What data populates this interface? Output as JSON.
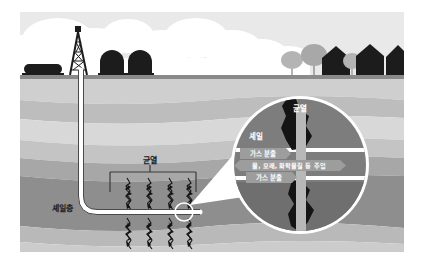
{
  "figure": {
    "language": "ko"
  },
  "colors": {
    "page_background": "#ffffff",
    "sky": "#e9e9e9",
    "cloud": "#ffffff",
    "ground_line": "#8a8a8a",
    "silhouette_dark": "#1c1c1c",
    "tree_gray": "#b4b4b4",
    "tree_gray_dark": "#9a9a9a",
    "layer_1": "#cfcfcf",
    "layer_2": "#bdbdbd",
    "layer_3": "#d8d8d8",
    "layer_4": "#c4c4c4",
    "layer_5": "#a7a7a7",
    "layer_6": "#8e8e8e",
    "layer_7": "#b9b9b9",
    "layer_8": "#cccccc",
    "shale_layer": "#8e8e8e",
    "well_casing": "#ffffff",
    "well_outline": "#4a4a4a",
    "fracture_black": "#141414",
    "callout_ring": "#ffffff",
    "callout_rock_upper": "#7d7d7d",
    "callout_rock_lower": "#6f6f6f",
    "callout_band": "#ffffff",
    "callout_pipe": "#b0b0b0",
    "label_chip": "#9d9d9d",
    "label_text": "#ffffff",
    "label_text_dark": "#1a1a1a"
  },
  "labels": {
    "fracture_main": "균열",
    "shale_layer": "셰일층",
    "callout_fracture": "균열",
    "callout_shale": "셰일",
    "gas_out_upper": "가스 분출",
    "injection": "물, 모래, 화학물질 등 주입",
    "gas_out_lower": "가스 분출"
  },
  "surface_features": [
    {
      "name": "horizontal-storage-tank",
      "x": 26,
      "y": 66
    },
    {
      "name": "drilling-derrick",
      "x": 72,
      "y": 30
    },
    {
      "name": "storage-tank-left",
      "x": 112,
      "y": 57
    },
    {
      "name": "storage-tank-right",
      "x": 140,
      "y": 57
    },
    {
      "name": "tree-gray-1",
      "x": 292,
      "y": 54
    },
    {
      "name": "tree-gray-2",
      "x": 312,
      "y": 48
    },
    {
      "name": "house-dark-1",
      "x": 326,
      "y": 48
    },
    {
      "name": "tree-gray-3",
      "x": 350,
      "y": 55
    },
    {
      "name": "house-dark-2",
      "x": 358,
      "y": 47
    },
    {
      "name": "house-dark-3",
      "x": 390,
      "y": 45
    }
  ],
  "fractures_upper": [
    {
      "x": 127
    },
    {
      "x": 148
    },
    {
      "x": 169
    },
    {
      "x": 188
    }
  ],
  "fractures_lower": [
    {
      "x": 127
    },
    {
      "x": 148
    },
    {
      "x": 169
    },
    {
      "x": 188
    }
  ],
  "well": {
    "surface_x": 84,
    "surface_y": 75,
    "vertical_bottom_y": 195,
    "horizontal_y": 212,
    "horizontal_end_x": 196
  },
  "callout": {
    "center_x": 300,
    "center_y": 165,
    "radius": 68
  }
}
